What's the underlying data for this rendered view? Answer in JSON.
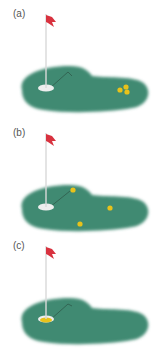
{
  "figure": {
    "clipped_caption": "· · · · ·",
    "colors": {
      "green": "#3f8a72",
      "green_edge": "#7fb6a3",
      "flag": "#d8323f",
      "pole": "#d9d9d9",
      "hole": "#eeeeee",
      "ball": "#e8c21a",
      "path_line": "#2f5a4a"
    },
    "panels": [
      {
        "label": "(a)",
        "description": "balls clustered together far from hole",
        "balls": [
          [
            120,
            82
          ],
          [
            126,
            79
          ],
          [
            127,
            85
          ]
        ],
        "ball_in_hole": false
      },
      {
        "label": "(b)",
        "description": "balls scattered across green",
        "balls": [
          [
            73,
            63
          ],
          [
            110,
            81
          ],
          [
            80,
            97
          ]
        ],
        "ball_in_hole": false
      },
      {
        "label": "(c)",
        "description": "ball in the hole",
        "balls": [],
        "ball_in_hole": true
      }
    ]
  }
}
